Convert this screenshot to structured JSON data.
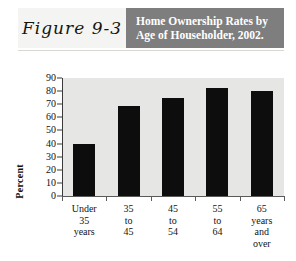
{
  "figure": {
    "label": "Figure 9-3",
    "title_line1": "Home Ownership Rates by",
    "title_line2": "Age of Householder, 2002.",
    "header_band_color": "#7e7e7e",
    "header_text_color": "#ffffff",
    "label_box_color": "#f4f4f2"
  },
  "chart_data": {
    "type": "bar",
    "title": "Home Ownership Rates by Age of Householder, 2002.",
    "xlabel": "",
    "ylabel": "Percent",
    "categories": [
      "Under 35 years",
      "35 to 45",
      "45 to 54",
      "55 to 64",
      "65 years and over"
    ],
    "category_lines": [
      [
        "Under",
        "35",
        "years"
      ],
      [
        "35",
        "to",
        "45"
      ],
      [
        "45",
        "to",
        "54"
      ],
      [
        "55",
        "to",
        "64"
      ],
      [
        "65",
        "years",
        "and",
        "over"
      ]
    ],
    "values": [
      40,
      69,
      75,
      82,
      80
    ],
    "ylim": [
      0,
      90
    ],
    "ytick_step": 10,
    "yticks": [
      0,
      10,
      20,
      30,
      40,
      50,
      60,
      70,
      80,
      90
    ],
    "ytick_labels": [
      "0",
      "10",
      "20",
      "30",
      "40",
      "50",
      "60",
      "70",
      "80",
      "90"
    ],
    "grid": false,
    "legend": false,
    "bar_color": "#0d0d0d",
    "plot_background": "#e6e6e4",
    "axis_color": "#3a3a3a"
  }
}
